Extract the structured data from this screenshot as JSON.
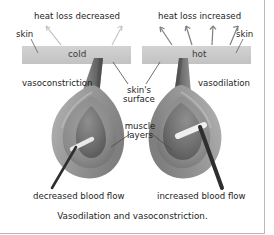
{
  "figure": {
    "caption": "Vasodilation and vasoconstriction.",
    "width": 274,
    "height": 235
  },
  "labels": {
    "heat_loss_left": "heat loss decreased",
    "heat_loss_right": "heat loss increased",
    "skin_left": "skin",
    "skin_right": "skin",
    "cold": "cold",
    "hot": "hot",
    "vasoconstriction": "vasoconstriction",
    "vasodilation": "vasodilation",
    "skins_surface": "skin's surface",
    "muscle_layers": "muscle layers",
    "decreased_blood_flow": "decreased blood flow",
    "increased_blood_flow": "increased blood flow"
  },
  "colors": {
    "skin_bar": "#c9c9c9",
    "vessel_outer": "#9a9a9a",
    "vessel_wall": "#8a8a8a",
    "vessel_inner": "#6e6e6e",
    "lumen": "#5a5a5a",
    "arrow_faint": "#c0c0c0",
    "arrow_strong": "#7d7d7d",
    "leader_line": "#4a4a4a",
    "text": "#1d1d1d",
    "frame": "#b9b9b9",
    "background": "#ffffff"
  },
  "diagram": {
    "panels": [
      {
        "name": "cold-panel",
        "condition": "cold",
        "response": "vasoconstriction",
        "heat_loss": "heat loss decreased",
        "blood_flow": "decreased blood flow",
        "heat_arrow_count": 2,
        "vessel_lumen_width": "narrow"
      },
      {
        "name": "hot-panel",
        "condition": "hot",
        "response": "vasodilation",
        "heat_loss": "heat loss increased",
        "blood_flow": "increased blood flow",
        "heat_arrow_count": 4,
        "vessel_lumen_width": "wide"
      }
    ]
  }
}
